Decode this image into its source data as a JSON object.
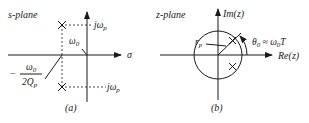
{
  "panel_a": {
    "plane_label": "s-plane",
    "x_axis_label": "σ",
    "upper_pole_label": "jω",
    "upper_pole_sub": "p",
    "lower_pole_label": "jω",
    "lower_pole_sub": "p",
    "natural_freq_label": "ω",
    "natural_freq_sub": "0",
    "real_part_minus": "−",
    "real_part_num": "ω",
    "real_part_num_sub": "0",
    "real_part_den": "2Q",
    "real_part_den_sub": "p",
    "caption": "(a)"
  },
  "panel_b": {
    "plane_label": "z-plane",
    "y_axis_label": "Im(z)",
    "x_axis_label": "Re(z)",
    "radius_label": "r",
    "radius_sub": "p",
    "angle_label_theta": "θ",
    "angle_label_theta_sub": "0",
    "angle_label_eq": " ≈ ω",
    "angle_label_omega_sub": "0",
    "angle_label_T": "T",
    "caption": "(b)"
  }
}
